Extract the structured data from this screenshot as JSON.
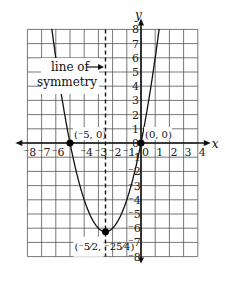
{
  "chart_data": {
    "type": "line",
    "title": "",
    "function": "y = x^2 + 5x",
    "xlabel": "x",
    "ylabel": "y",
    "xlim": [
      -8,
      4
    ],
    "ylim": [
      -8,
      8
    ],
    "grid": true,
    "x_ticks": [
      "-8",
      "-7",
      "-6",
      "-4",
      "-3",
      "-2",
      "-1",
      "0",
      "1",
      "2",
      "3",
      "4"
    ],
    "y_ticks": [
      "8",
      "7",
      "6",
      "5",
      "4",
      "3",
      "2",
      "1",
      "0",
      "-1",
      "-2",
      "-3",
      "-4",
      "-5",
      "-6",
      "-7",
      "-8"
    ],
    "points": [
      {
        "x": -5,
        "y": 0,
        "label": "(-5, 0)"
      },
      {
        "x": 0,
        "y": 0,
        "label": "(0, 0)"
      },
      {
        "x": -2.5,
        "y": -6.25,
        "label": "(-5/2, -25/4)"
      }
    ],
    "line_of_symmetry": {
      "x": -2.5,
      "label": "line of symmetry"
    },
    "annotations": [
      "line of",
      "symmetry"
    ]
  }
}
